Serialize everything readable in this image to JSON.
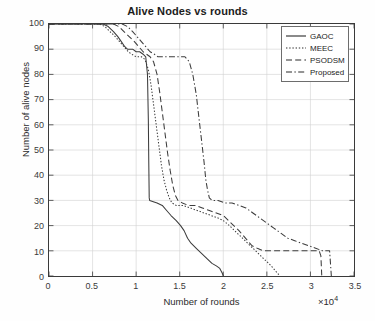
{
  "chart_data": {
    "type": "line",
    "title": "Alive Nodes vs rounds",
    "xlabel": "Number of rounds",
    "ylabel": "Number of alive nodes",
    "x_multiplier": "×10",
    "x_multiplier_exp": "4",
    "xlim": [
      0,
      35000
    ],
    "ylim": [
      0,
      100
    ],
    "xticks": [
      0,
      5000,
      10000,
      15000,
      20000,
      25000,
      30000,
      35000
    ],
    "xtick_labels": [
      "0",
      "0.5",
      "1",
      "1.5",
      "2",
      "2.5",
      "3",
      "3.5"
    ],
    "yticks": [
      0,
      10,
      20,
      30,
      40,
      50,
      60,
      70,
      80,
      90,
      100
    ],
    "ytick_labels": [
      "0",
      "10",
      "20",
      "30",
      "40",
      "50",
      "60",
      "70",
      "80",
      "90",
      "100"
    ],
    "grid": true,
    "legend_position": "top-right",
    "series": [
      {
        "name": "GAOC",
        "style": "solid",
        "color": "#3c3c3c",
        "points": [
          [
            0,
            100
          ],
          [
            6200,
            100
          ],
          [
            6800,
            99
          ],
          [
            7400,
            97
          ],
          [
            7900,
            95
          ],
          [
            8300,
            93
          ],
          [
            8700,
            91
          ],
          [
            9000,
            90
          ],
          [
            9600,
            90
          ],
          [
            10000,
            89
          ],
          [
            10400,
            89
          ],
          [
            10800,
            88
          ],
          [
            11100,
            87
          ],
          [
            11300,
            80
          ],
          [
            11400,
            62
          ],
          [
            11450,
            45
          ],
          [
            11500,
            31
          ],
          [
            11550,
            30
          ],
          [
            12400,
            29
          ],
          [
            13000,
            28
          ],
          [
            13500,
            26
          ],
          [
            14000,
            24
          ],
          [
            14600,
            22
          ],
          [
            15100,
            20
          ],
          [
            15500,
            18
          ],
          [
            15900,
            15
          ],
          [
            16300,
            13
          ],
          [
            16900,
            11
          ],
          [
            17500,
            9
          ],
          [
            18100,
            7
          ],
          [
            18700,
            5
          ],
          [
            19200,
            4
          ],
          [
            19600,
            3
          ],
          [
            19900,
            1
          ],
          [
            20000,
            0
          ]
        ]
      },
      {
        "name": "MEEC",
        "style": "dotted",
        "color": "#3c3c3c",
        "points": [
          [
            0,
            100
          ],
          [
            5800,
            100
          ],
          [
            6400,
            99
          ],
          [
            7000,
            97
          ],
          [
            7600,
            95
          ],
          [
            8100,
            93
          ],
          [
            8600,
            91
          ],
          [
            9100,
            89
          ],
          [
            9500,
            88
          ],
          [
            10000,
            87
          ],
          [
            10600,
            87
          ],
          [
            11000,
            86
          ],
          [
            11400,
            82
          ],
          [
            11700,
            76
          ],
          [
            12000,
            68
          ],
          [
            12300,
            60
          ],
          [
            12600,
            52
          ],
          [
            12900,
            44
          ],
          [
            13200,
            38
          ],
          [
            13500,
            34
          ],
          [
            13800,
            31
          ],
          [
            14100,
            29
          ],
          [
            14600,
            28
          ],
          [
            15400,
            28
          ],
          [
            16200,
            27
          ],
          [
            17000,
            26
          ],
          [
            17800,
            25
          ],
          [
            18600,
            24
          ],
          [
            19400,
            23
          ],
          [
            20000,
            22
          ],
          [
            20700,
            20
          ],
          [
            21300,
            18
          ],
          [
            21900,
            16
          ],
          [
            22500,
            14
          ],
          [
            23100,
            12
          ],
          [
            23700,
            10
          ],
          [
            24300,
            8
          ],
          [
            24900,
            6
          ],
          [
            25500,
            4
          ],
          [
            26000,
            2
          ],
          [
            26500,
            0
          ]
        ]
      },
      {
        "name": "PSODSM",
        "style": "dashed",
        "color": "#3c3c3c",
        "points": [
          [
            0,
            100
          ],
          [
            7400,
            100
          ],
          [
            8000,
            99
          ],
          [
            8600,
            97
          ],
          [
            9200,
            95
          ],
          [
            9800,
            93
          ],
          [
            10300,
            91
          ],
          [
            10800,
            89
          ],
          [
            11200,
            88
          ],
          [
            11600,
            87
          ],
          [
            12000,
            85
          ],
          [
            12400,
            80
          ],
          [
            12700,
            73
          ],
          [
            13000,
            65
          ],
          [
            13300,
            57
          ],
          [
            13600,
            49
          ],
          [
            13900,
            42
          ],
          [
            14200,
            36
          ],
          [
            14500,
            32
          ],
          [
            14800,
            30
          ],
          [
            15300,
            29
          ],
          [
            16000,
            28
          ],
          [
            16800,
            28
          ],
          [
            17600,
            27
          ],
          [
            18400,
            26
          ],
          [
            19200,
            25
          ],
          [
            20000,
            24
          ],
          [
            20600,
            22
          ],
          [
            21200,
            20
          ],
          [
            21800,
            18
          ],
          [
            22300,
            16
          ],
          [
            22800,
            14
          ],
          [
            23300,
            12
          ],
          [
            23900,
            11
          ],
          [
            24600,
            10
          ],
          [
            26000,
            10
          ],
          [
            28000,
            10
          ],
          [
            30000,
            10
          ],
          [
            31000,
            10
          ],
          [
            31200,
            8
          ],
          [
            31300,
            0
          ]
        ]
      },
      {
        "name": "Proposed",
        "style": "dashdot",
        "color": "#3c3c3c",
        "points": [
          [
            0,
            100
          ],
          [
            8400,
            100
          ],
          [
            9000,
            99
          ],
          [
            9600,
            97
          ],
          [
            10100,
            95
          ],
          [
            10600,
            93
          ],
          [
            11100,
            91
          ],
          [
            11600,
            89
          ],
          [
            12100,
            88
          ],
          [
            12500,
            87
          ],
          [
            13500,
            87
          ],
          [
            14500,
            87
          ],
          [
            15600,
            87
          ],
          [
            16100,
            85
          ],
          [
            16500,
            80
          ],
          [
            16900,
            72
          ],
          [
            17200,
            63
          ],
          [
            17500,
            54
          ],
          [
            17800,
            45
          ],
          [
            18000,
            38
          ],
          [
            18200,
            34
          ],
          [
            18400,
            31
          ],
          [
            18700,
            30
          ],
          [
            19400,
            30
          ],
          [
            20200,
            29
          ],
          [
            21000,
            29
          ],
          [
            21800,
            28
          ],
          [
            22600,
            27
          ],
          [
            23400,
            25
          ],
          [
            24200,
            23
          ],
          [
            25000,
            21
          ],
          [
            25800,
            19
          ],
          [
            26600,
            17
          ],
          [
            27400,
            15
          ],
          [
            28200,
            14
          ],
          [
            29000,
            13
          ],
          [
            29800,
            12
          ],
          [
            30600,
            11
          ],
          [
            31400,
            10
          ],
          [
            32200,
            10
          ],
          [
            32300,
            5
          ],
          [
            32400,
            0
          ]
        ]
      }
    ]
  },
  "legend": {
    "items": [
      {
        "label": "GAOC",
        "style": "solid"
      },
      {
        "label": "MEEC",
        "style": "dotted"
      },
      {
        "label": "PSODSM",
        "style": "dashed"
      },
      {
        "label": "Proposed",
        "style": "dashdot"
      }
    ]
  }
}
